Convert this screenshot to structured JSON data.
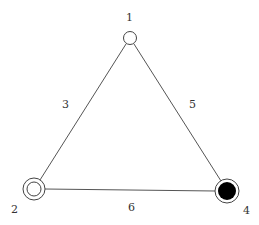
{
  "diagram": {
    "type": "graph",
    "nodes": [
      {
        "id": "1",
        "label": "1",
        "style": "open-circle",
        "x": 130,
        "y": 38,
        "label_x": 129,
        "label_y": 21
      },
      {
        "id": "2",
        "label": "2",
        "style": "double-circle",
        "x": 34,
        "y": 189,
        "label_x": 14,
        "label_y": 213
      },
      {
        "id": "4",
        "label": "4",
        "style": "filled-ring",
        "x": 227,
        "y": 191,
        "label_x": 246,
        "label_y": 214
      }
    ],
    "edges": [
      {
        "from": "1",
        "to": "2",
        "label": "3",
        "label_x": 65,
        "label_y": 108
      },
      {
        "from": "1",
        "to": "4",
        "label": "5",
        "label_x": 192,
        "label_y": 108
      },
      {
        "from": "2",
        "to": "4",
        "label": "6",
        "label_x": 131,
        "label_y": 211
      }
    ],
    "colors": {
      "line": "#555555",
      "node_stroke": "#444444",
      "node_fill_dark": "#000000",
      "label": "#333333"
    }
  }
}
